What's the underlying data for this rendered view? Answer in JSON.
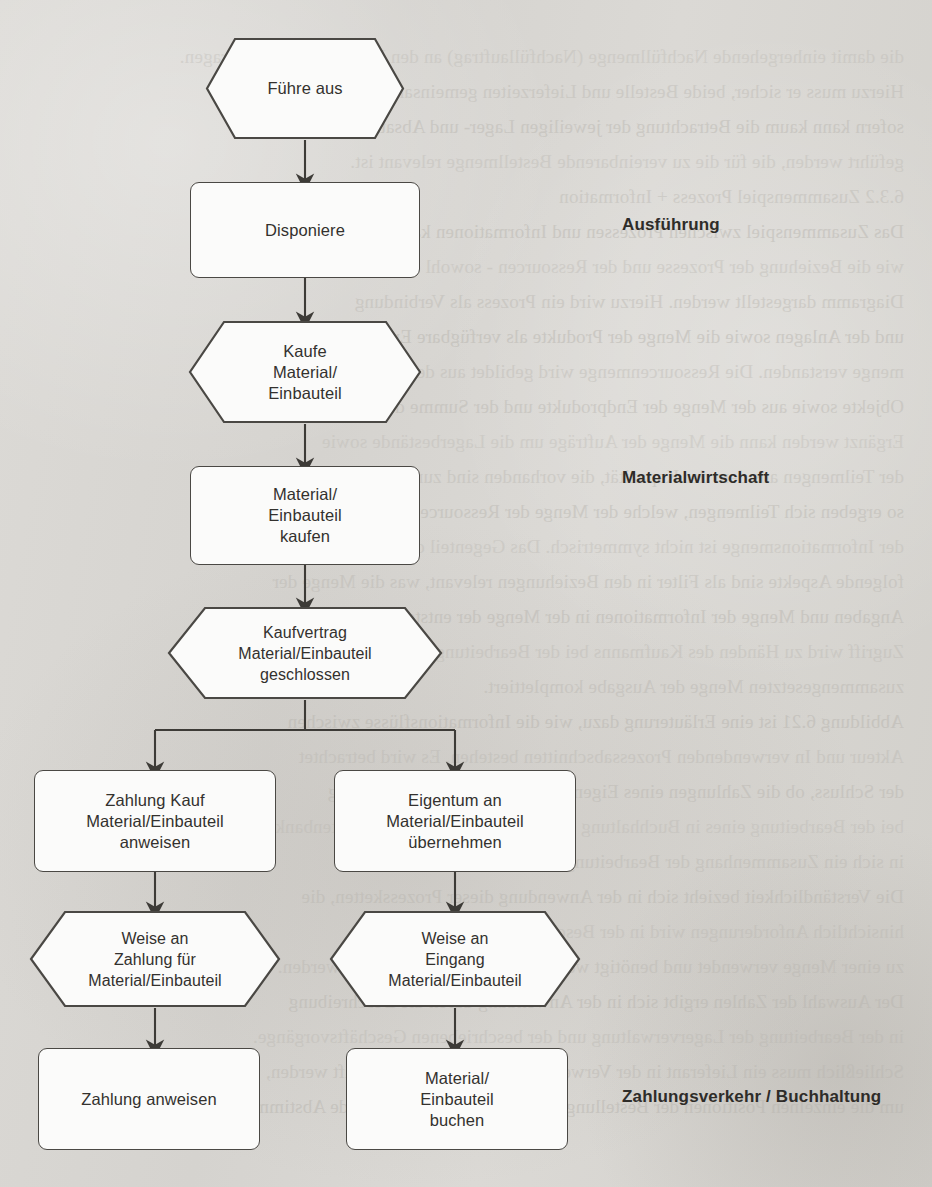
{
  "diagram": {
    "colors": {
      "paper": "#d8d6d2",
      "node_fill": "#fbfbfa",
      "node_stroke": "#4a4844",
      "text": "#33312e",
      "connector": "#3d3b37"
    },
    "nodes": [
      {
        "id": "n1",
        "shape": "hexagon",
        "lines": [
          "Führe aus"
        ]
      },
      {
        "id": "n2",
        "shape": "rounded-rect",
        "lines": [
          "Disponiere"
        ]
      },
      {
        "id": "n3",
        "shape": "hexagon",
        "lines": [
          "Kaufe",
          "Material/",
          "Einbauteil"
        ]
      },
      {
        "id": "n4",
        "shape": "rounded-rect",
        "lines": [
          "Material/",
          "Einbauteil",
          "kaufen"
        ]
      },
      {
        "id": "n5",
        "shape": "hexagon",
        "lines": [
          "Kaufvertrag",
          "Material/Einbauteil",
          "geschlossen"
        ]
      },
      {
        "id": "n6",
        "shape": "rounded-rect",
        "lines": [
          "Zahlung Kauf",
          "Material/Einbauteil",
          "anweisen"
        ]
      },
      {
        "id": "n7",
        "shape": "rounded-rect",
        "lines": [
          "Eigentum an",
          "Material/Einbauteil",
          "übernehmen"
        ]
      },
      {
        "id": "n8",
        "shape": "hexagon",
        "lines": [
          "Weise an",
          "Zahlung für",
          "Material/Einbauteil"
        ]
      },
      {
        "id": "n9",
        "shape": "hexagon",
        "lines": [
          "Weise an",
          "Eingang",
          "Material/Einbauteil"
        ]
      },
      {
        "id": "n10",
        "shape": "rounded-rect",
        "lines": [
          "Zahlung anweisen"
        ]
      },
      {
        "id": "n11",
        "shape": "rounded-rect",
        "lines": [
          "Material/",
          "Einbauteil",
          "buchen"
        ]
      }
    ],
    "swimlane_labels": [
      {
        "id": "lane1",
        "text": "Ausführung"
      },
      {
        "id": "lane2",
        "text": "Materialwirtschaft"
      },
      {
        "id": "lane3",
        "text": "Zahlungsverkehr / Buchhaltung"
      }
    ],
    "background_bleed": [
      "die damit einhergehende Nachfüllmenge (Nachfüllauftrag) an den Lieferanten zu übertragen.",
      "Hierzu muss er sicher, beide Bestelle und Lieferzeiten gemeinsam zu regeln. In",
      "sofern kann kaum die Betrachtung der jeweiligen Lager- und Absatzdaten durch-",
      "geführt werden, die für die zu vereinbarende Bestellmenge relevant ist.",
      "6.3.2 Zusammenspiel Prozess + Information",
      "Das Zusammenspiel zwischen Prozessen und Informationen kann - ebenso",
      "wie die Beziehung der Prozesse und der Ressourcen - sowohl dargestellt in einem",
      "Diagramm dargestellt werden. Hierzu wird ein Prozess als Verbindung",
      "und der Anlagen sowie die Menge der Produkte als verfügbare Ergebnis-",
      "menge verstanden. Die Ressourcenmenge wird gebildet aus der Verwendung der",
      "Objekte sowie aus der Menge der Endprodukte und der Summe der Aufträge.",
      "Ergänzt werden kann die Menge der Aufträge um die Lagerbestände sowie",
      "der Teilmengen aus dem der Kapazität, die vorhanden sind zur Information,",
      "so ergeben sich Teilmengen, welche der Menge der Ressourcen, der Menge",
      "der Informationsmenge ist nicht symmetrisch. Das Gegenteil dabei ist und",
      "folgende Aspekte sind als Filter in den Beziehungen relevant, was die Menge der",
      "Angaben und Menge der Informationen in der Menge der entstehende",
      "Zugriff wird zu Händen des Kaufmanns bei der Bearbeitung der eigentlich",
      "zusammengesetzten Menge der Ausgabe komplettiert.",
      "Abbildung 6.21 ist eine Erläuterung dazu, wie die Informationsflüsse zwischen",
      "Akteur und In verwendenden Prozessabschnitten bestehen. Es wird betrachtet",
      "der Schluss, ob die Zahlungen eines Eigentumswechsels und die Buchung",
      "bei der Bearbeitung eines in Buchhaltung sowie der Verwendung von Datenbanken",
      "in sich ein Zusammenhang der Bearbeitung und der Materialwirtschaft.",
      "Die Verständlichkeit bezieht sich in der Anwendung dieser Prozessketten, die",
      "hinsichtlich Anforderungen wird in der Beschreibung eines Ablaufs",
      "zu einer Menge verwendet und benötigt werden. Gehandelt oder erstellt werden.",
      "Der Auswahl der Zahlen ergibt sich in der Anwendung durch die Beschreibung",
      "in der Bearbeitung der Lagerverwaltung und der beschriebenen Geschäftsvorgänge.",
      "Schließlich muss ein Lieferant in der Verwendung des Verfahrens geprüft werden,",
      "um die einzelnen Positionen der Bestellung vorher, die daraus bestehende Abstimmung"
    ]
  }
}
